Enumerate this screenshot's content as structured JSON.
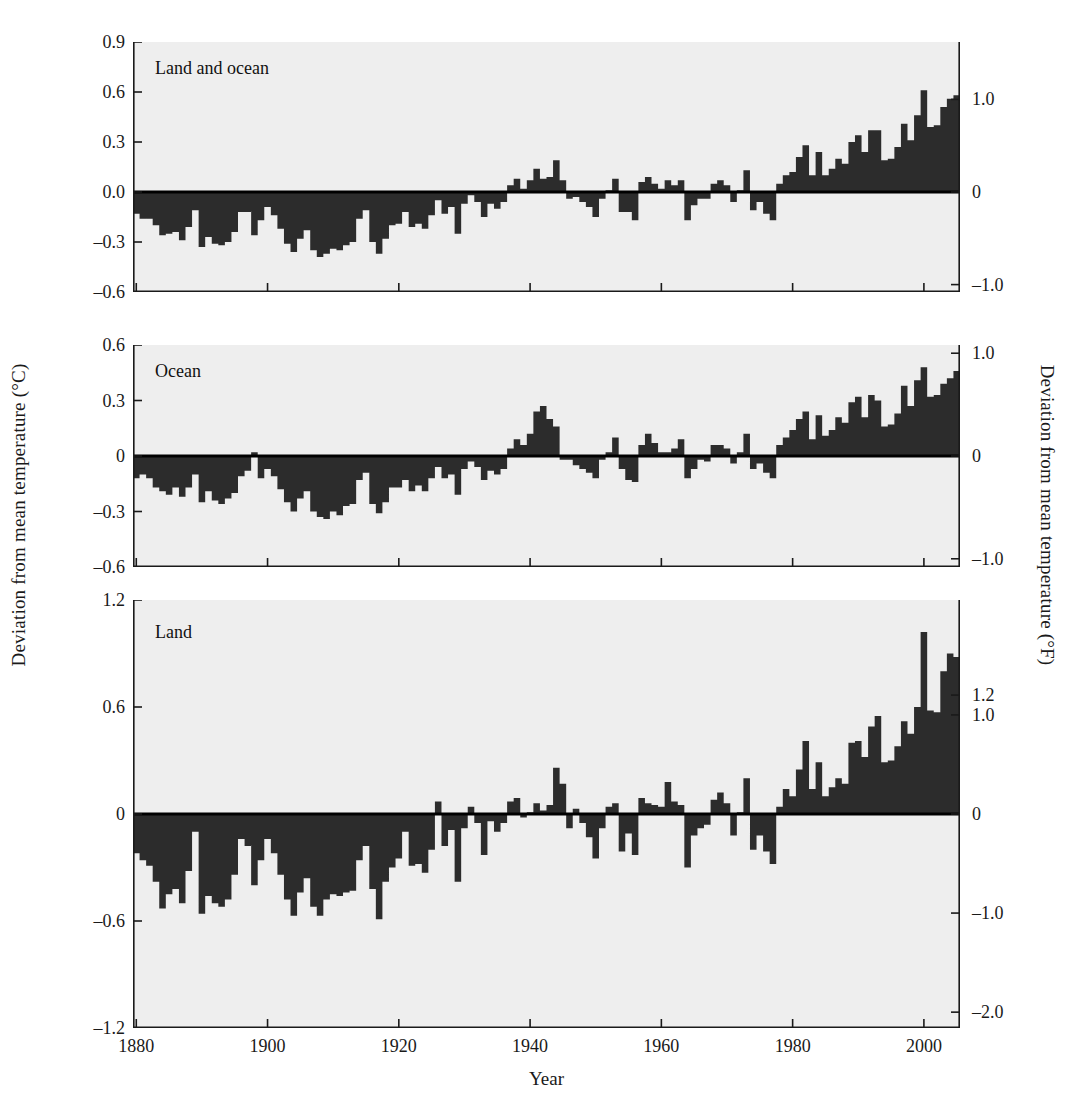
{
  "figure": {
    "xlabel": "Year",
    "ylabel_left": "Deviation from mean temperature (°C)",
    "ylabel_right": "Deviation from mean temperature (°F)",
    "background_color": "#eeeeee",
    "bar_color": "#2c2c2c",
    "axis_color": "#1a1a1a"
  },
  "xaxis": {
    "ticks": [
      1880,
      1900,
      1920,
      1940,
      1960,
      1980,
      2000
    ],
    "tick_labels": [
      "1880",
      "1900",
      "1920",
      "1940",
      "1960",
      "1980",
      "2000"
    ],
    "min": 1880,
    "max": 2005
  },
  "chart_data": [
    {
      "type": "bar",
      "title": "Land and ocean",
      "xlabel": "Year",
      "ylabel": "Deviation from mean temperature (°C)",
      "ylabel_right": "Deviation from mean temperature (°F)",
      "ylim": [
        -0.6,
        0.9
      ],
      "yticks": [
        -0.6,
        -0.3,
        0.0,
        0.3,
        0.6,
        0.9
      ],
      "ytick_labels": [
        "–0.6",
        "–0.3",
        "0.0",
        "0.3",
        "0.6",
        "0.9"
      ],
      "ylim_right": [
        -1.08,
        1.62
      ],
      "yticks_right": [
        -1.0,
        0.0,
        1.0
      ],
      "ytick_labels_right": [
        "–1.0",
        "0",
        "1.0"
      ],
      "grid": false,
      "legend": "none",
      "x": [
        1880,
        1881,
        1882,
        1883,
        1884,
        1885,
        1886,
        1887,
        1888,
        1889,
        1890,
        1891,
        1892,
        1893,
        1894,
        1895,
        1896,
        1897,
        1898,
        1899,
        1900,
        1901,
        1902,
        1903,
        1904,
        1905,
        1906,
        1907,
        1908,
        1909,
        1910,
        1911,
        1912,
        1913,
        1914,
        1915,
        1916,
        1917,
        1918,
        1919,
        1920,
        1921,
        1922,
        1923,
        1924,
        1925,
        1926,
        1927,
        1928,
        1929,
        1930,
        1931,
        1932,
        1933,
        1934,
        1935,
        1936,
        1937,
        1938,
        1939,
        1940,
        1941,
        1942,
        1943,
        1944,
        1945,
        1946,
        1947,
        1948,
        1949,
        1950,
        1951,
        1952,
        1953,
        1954,
        1955,
        1956,
        1957,
        1958,
        1959,
        1960,
        1961,
        1962,
        1963,
        1964,
        1965,
        1966,
        1967,
        1968,
        1969,
        1970,
        1971,
        1972,
        1973,
        1974,
        1975,
        1976,
        1977,
        1978,
        1979,
        1980,
        1981,
        1982,
        1983,
        1984,
        1985,
        1986,
        1987,
        1988,
        1989,
        1990,
        1991,
        1992,
        1993,
        1994,
        1995,
        1996,
        1997,
        1998,
        1999,
        2000,
        2001,
        2002,
        2003,
        2004,
        2005
      ],
      "values": [
        -0.13,
        -0.16,
        -0.16,
        -0.2,
        -0.26,
        -0.25,
        -0.24,
        -0.29,
        -0.21,
        -0.11,
        -0.33,
        -0.27,
        -0.31,
        -0.32,
        -0.3,
        -0.24,
        -0.12,
        -0.12,
        -0.26,
        -0.17,
        -0.09,
        -0.14,
        -0.22,
        -0.31,
        -0.36,
        -0.28,
        -0.23,
        -0.35,
        -0.39,
        -0.37,
        -0.34,
        -0.35,
        -0.32,
        -0.3,
        -0.16,
        -0.11,
        -0.3,
        -0.37,
        -0.28,
        -0.2,
        -0.19,
        -0.12,
        -0.21,
        -0.19,
        -0.22,
        -0.14,
        -0.05,
        -0.13,
        -0.09,
        -0.25,
        -0.07,
        -0.02,
        -0.06,
        -0.15,
        -0.07,
        -0.1,
        -0.06,
        0.04,
        0.08,
        0.02,
        0.07,
        0.14,
        0.08,
        0.09,
        0.19,
        0.07,
        -0.04,
        -0.03,
        -0.06,
        -0.09,
        -0.15,
        -0.04,
        0.01,
        0.08,
        -0.12,
        -0.12,
        -0.17,
        0.06,
        0.09,
        0.05,
        0.02,
        0.07,
        0.04,
        0.07,
        -0.17,
        -0.08,
        -0.04,
        -0.04,
        0.05,
        0.07,
        0.04,
        -0.06,
        0.01,
        0.13,
        -0.11,
        -0.06,
        -0.13,
        -0.17,
        0.05,
        0.1,
        0.12,
        0.21,
        0.28,
        0.1,
        0.24,
        0.1,
        0.14,
        0.2,
        0.17,
        0.3,
        0.34,
        0.24,
        0.37,
        0.37,
        0.19,
        0.2,
        0.27,
        0.41,
        0.31,
        0.46,
        0.61,
        0.39,
        0.4,
        0.51,
        0.56,
        0.58,
        0.53,
        0.59
      ]
    },
    {
      "type": "bar",
      "title": "Ocean",
      "xlabel": "Year",
      "ylabel": "Deviation from mean temperature (°C)",
      "ylabel_right": "Deviation from mean temperature (°F)",
      "ylim": [
        -0.6,
        0.6
      ],
      "yticks": [
        -0.6,
        -0.3,
        0.0,
        0.3,
        0.6
      ],
      "ytick_labels": [
        "–0.6",
        "–0.3",
        "0",
        "0.3",
        "0.6"
      ],
      "ylim_right": [
        -1.08,
        1.08
      ],
      "yticks_right": [
        -1.0,
        0.0,
        1.0
      ],
      "ytick_labels_right": [
        "–1.0",
        "0",
        "1.0"
      ],
      "grid": false,
      "legend": "none",
      "x": [
        1880,
        1881,
        1882,
        1883,
        1884,
        1885,
        1886,
        1887,
        1888,
        1889,
        1890,
        1891,
        1892,
        1893,
        1894,
        1895,
        1896,
        1897,
        1898,
        1899,
        1900,
        1901,
        1902,
        1903,
        1904,
        1905,
        1906,
        1907,
        1908,
        1909,
        1910,
        1911,
        1912,
        1913,
        1914,
        1915,
        1916,
        1917,
        1918,
        1919,
        1920,
        1921,
        1922,
        1923,
        1924,
        1925,
        1926,
        1927,
        1928,
        1929,
        1930,
        1931,
        1932,
        1933,
        1934,
        1935,
        1936,
        1937,
        1938,
        1939,
        1940,
        1941,
        1942,
        1943,
        1944,
        1945,
        1946,
        1947,
        1948,
        1949,
        1950,
        1951,
        1952,
        1953,
        1954,
        1955,
        1956,
        1957,
        1958,
        1959,
        1960,
        1961,
        1962,
        1963,
        1964,
        1965,
        1966,
        1967,
        1968,
        1969,
        1970,
        1971,
        1972,
        1973,
        1974,
        1975,
        1976,
        1977,
        1978,
        1979,
        1980,
        1981,
        1982,
        1983,
        1984,
        1985,
        1986,
        1987,
        1988,
        1989,
        1990,
        1991,
        1992,
        1993,
        1994,
        1995,
        1996,
        1997,
        1998,
        1999,
        2000,
        2001,
        2002,
        2003,
        2004,
        2005
      ],
      "values": [
        -0.12,
        -0.1,
        -0.12,
        -0.17,
        -0.19,
        -0.21,
        -0.17,
        -0.22,
        -0.17,
        -0.1,
        -0.25,
        -0.19,
        -0.24,
        -0.26,
        -0.23,
        -0.2,
        -0.11,
        -0.08,
        0.02,
        -0.12,
        -0.07,
        -0.11,
        -0.18,
        -0.25,
        -0.3,
        -0.23,
        -0.19,
        -0.3,
        -0.33,
        -0.34,
        -0.3,
        -0.32,
        -0.27,
        -0.26,
        -0.13,
        -0.09,
        -0.26,
        -0.31,
        -0.25,
        -0.17,
        -0.17,
        -0.13,
        -0.19,
        -0.16,
        -0.19,
        -0.12,
        -0.06,
        -0.12,
        -0.1,
        -0.21,
        -0.07,
        -0.03,
        -0.06,
        -0.13,
        -0.08,
        -0.1,
        -0.07,
        0.04,
        0.09,
        0.06,
        0.12,
        0.24,
        0.27,
        0.2,
        0.16,
        -0.02,
        -0.02,
        -0.05,
        -0.07,
        -0.09,
        -0.12,
        -0.02,
        0.02,
        0.1,
        -0.07,
        -0.13,
        -0.14,
        0.06,
        0.12,
        0.07,
        0.02,
        0.02,
        0.04,
        0.09,
        -0.12,
        -0.07,
        -0.02,
        -0.03,
        0.06,
        0.06,
        0.04,
        -0.04,
        0.02,
        0.12,
        -0.07,
        -0.04,
        -0.09,
        -0.12,
        0.06,
        0.1,
        0.14,
        0.2,
        0.24,
        0.09,
        0.22,
        0.11,
        0.14,
        0.21,
        0.18,
        0.29,
        0.32,
        0.21,
        0.33,
        0.3,
        0.16,
        0.17,
        0.23,
        0.38,
        0.27,
        0.41,
        0.48,
        0.32,
        0.33,
        0.39,
        0.42,
        0.46,
        0.42,
        0.47
      ]
    },
    {
      "type": "bar",
      "title": "Land",
      "xlabel": "Year",
      "ylabel": "Deviation from mean temperature (°C)",
      "ylabel_right": "Deviation from mean temperature (°F)",
      "ylim": [
        -1.2,
        1.2
      ],
      "yticks": [
        -1.2,
        -0.6,
        0.0,
        0.6,
        1.2
      ],
      "ytick_labels": [
        "–1.2",
        "–0.6",
        "0",
        "0.6",
        "1.2"
      ],
      "ylim_right": [
        -2.16,
        2.16
      ],
      "yticks_right": [
        -2.0,
        -1.0,
        0.0,
        1.0,
        1.2
      ],
      "ytick_labels_right": [
        "–2.0",
        "–1.0",
        "0",
        "1.0",
        "1.2"
      ],
      "grid": false,
      "legend": "none",
      "x": [
        1880,
        1881,
        1882,
        1883,
        1884,
        1885,
        1886,
        1887,
        1888,
        1889,
        1890,
        1891,
        1892,
        1893,
        1894,
        1895,
        1896,
        1897,
        1898,
        1899,
        1900,
        1901,
        1902,
        1903,
        1904,
        1905,
        1906,
        1907,
        1908,
        1909,
        1910,
        1911,
        1912,
        1913,
        1914,
        1915,
        1916,
        1917,
        1918,
        1919,
        1920,
        1921,
        1922,
        1923,
        1924,
        1925,
        1926,
        1927,
        1928,
        1929,
        1930,
        1931,
        1932,
        1933,
        1934,
        1935,
        1936,
        1937,
        1938,
        1939,
        1940,
        1941,
        1942,
        1943,
        1944,
        1945,
        1946,
        1947,
        1948,
        1949,
        1950,
        1951,
        1952,
        1953,
        1954,
        1955,
        1956,
        1957,
        1958,
        1959,
        1960,
        1961,
        1962,
        1963,
        1964,
        1965,
        1966,
        1967,
        1968,
        1969,
        1970,
        1971,
        1972,
        1973,
        1974,
        1975,
        1976,
        1977,
        1978,
        1979,
        1980,
        1981,
        1982,
        1983,
        1984,
        1985,
        1986,
        1987,
        1988,
        1989,
        1990,
        1991,
        1992,
        1993,
        1994,
        1995,
        1996,
        1997,
        1998,
        1999,
        2000,
        2001,
        2002,
        2003,
        2004,
        2005
      ],
      "values": [
        -0.22,
        -0.26,
        -0.29,
        -0.38,
        -0.53,
        -0.45,
        -0.42,
        -0.5,
        -0.32,
        -0.1,
        -0.56,
        -0.46,
        -0.5,
        -0.52,
        -0.48,
        -0.34,
        -0.14,
        -0.18,
        -0.4,
        -0.26,
        -0.14,
        -0.22,
        -0.34,
        -0.48,
        -0.57,
        -0.44,
        -0.36,
        -0.52,
        -0.57,
        -0.48,
        -0.45,
        -0.46,
        -0.44,
        -0.43,
        -0.26,
        -0.18,
        -0.42,
        -0.59,
        -0.38,
        -0.3,
        -0.25,
        -0.1,
        -0.29,
        -0.28,
        -0.33,
        -0.2,
        0.07,
        -0.18,
        -0.09,
        -0.38,
        -0.08,
        0.04,
        -0.05,
        -0.23,
        -0.04,
        -0.1,
        -0.05,
        0.07,
        0.09,
        -0.02,
        0.01,
        0.06,
        0.02,
        0.05,
        0.26,
        0.17,
        -0.08,
        0.03,
        -0.05,
        -0.13,
        -0.25,
        -0.08,
        0.04,
        0.06,
        -0.21,
        -0.11,
        -0.23,
        0.09,
        0.06,
        0.05,
        0.04,
        0.18,
        0.07,
        0.05,
        -0.3,
        -0.12,
        -0.08,
        -0.06,
        0.08,
        0.12,
        0.06,
        -0.12,
        0.01,
        0.2,
        -0.2,
        -0.12,
        -0.21,
        -0.28,
        0.04,
        0.14,
        0.1,
        0.25,
        0.41,
        0.14,
        0.29,
        0.1,
        0.15,
        0.2,
        0.17,
        0.4,
        0.41,
        0.32,
        0.49,
        0.55,
        0.29,
        0.3,
        0.38,
        0.52,
        0.45,
        0.6,
        1.02,
        0.58,
        0.57,
        0.8,
        0.9,
        0.88,
        0.8,
        0.86
      ]
    }
  ],
  "panels": [
    {
      "label": "Land and ocean"
    },
    {
      "label": "Ocean"
    },
    {
      "label": "Land"
    }
  ]
}
